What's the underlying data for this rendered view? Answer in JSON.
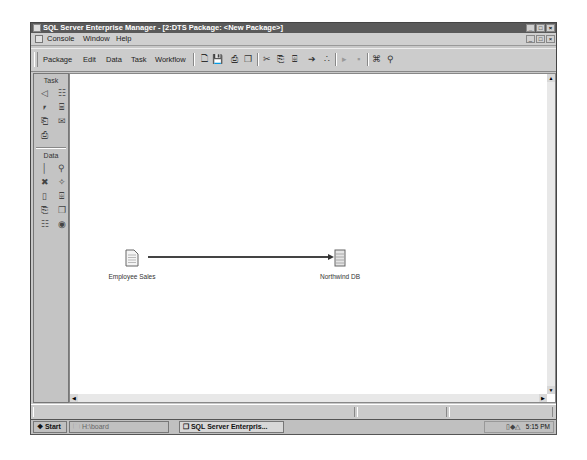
{
  "window": {
    "title": "SQL Server Enterprise Manager - [2:DTS Package: <New Package>]",
    "controls": [
      "_",
      "□",
      "×"
    ]
  },
  "menubar": {
    "items": [
      {
        "label": "Console"
      },
      {
        "label": "Window"
      },
      {
        "label": "Help"
      }
    ],
    "mdi_controls": [
      "_",
      "□",
      "×"
    ]
  },
  "toolbar": {
    "menus": [
      {
        "label": "Package"
      },
      {
        "label": "Edit"
      },
      {
        "label": "Data"
      },
      {
        "label": "Task"
      },
      {
        "label": "Workflow"
      }
    ],
    "buttons": [
      {
        "name": "new-icon",
        "glyph": "🗋"
      },
      {
        "name": "save-icon",
        "glyph": "💾"
      },
      {
        "name": "print-icon",
        "glyph": "⎙"
      },
      {
        "name": "properties-icon",
        "glyph": "❐"
      },
      {
        "name": "cut-icon",
        "glyph": "✂"
      },
      {
        "name": "copy-icon",
        "glyph": "⎘"
      },
      {
        "name": "paste-icon",
        "glyph": "⌹"
      },
      {
        "name": "connect-icon",
        "glyph": "➔"
      },
      {
        "name": "transform-icon",
        "glyph": "∴"
      },
      {
        "name": "run-icon",
        "glyph": "▸"
      },
      {
        "name": "stop-icon",
        "glyph": "▪"
      },
      {
        "name": "layout-icon",
        "glyph": "⌘"
      },
      {
        "name": "zoom-icon",
        "glyph": "⚲"
      }
    ]
  },
  "palette": {
    "task_header": "Task",
    "task_items": [
      {
        "name": "active-x-script-task-icon",
        "glyph": "◁"
      },
      {
        "name": "transfer-objects-task-icon",
        "glyph": "☷"
      },
      {
        "name": "execute-sql-task-icon",
        "glyph": "⎖"
      },
      {
        "name": "data-driven-query-task-icon",
        "glyph": "⌸"
      },
      {
        "name": "bulk-insert-task-icon",
        "glyph": "⎗"
      },
      {
        "name": "send-mail-task-icon",
        "glyph": "✉"
      },
      {
        "name": "execute-process-task-icon",
        "glyph": "⎙"
      }
    ],
    "data_header": "Data",
    "data_items": [
      {
        "name": "sql-server-connection-icon",
        "glyph": "│"
      },
      {
        "name": "access-connection-icon",
        "glyph": "⚲"
      },
      {
        "name": "excel-connection-icon",
        "glyph": "✖"
      },
      {
        "name": "oracle-connection-icon",
        "glyph": "✧"
      },
      {
        "name": "dbase-connection-icon",
        "glyph": "▯"
      },
      {
        "name": "paradox-connection-icon",
        "glyph": "⌹"
      },
      {
        "name": "text-file-source-icon",
        "glyph": "⎘"
      },
      {
        "name": "text-file-destination-icon",
        "glyph": "❐"
      },
      {
        "name": "odbc-connection-icon",
        "glyph": "☷"
      },
      {
        "name": "other-connection-icon",
        "glyph": "◉"
      }
    ]
  },
  "canvas": {
    "nodes": [
      {
        "label": "Employee Sales",
        "icon": "text-file-icon"
      },
      {
        "label": "Northwind DB",
        "icon": "database-server-icon"
      }
    ],
    "connection": {
      "from": "Employee Sales",
      "to": "Northwind DB",
      "type": "transform-data-arrow"
    }
  },
  "scrollbars": {
    "up": "▲",
    "down": "▼",
    "left": "◀",
    "right": "▶"
  },
  "taskbar": {
    "start_label": "Start",
    "buttons": [
      {
        "label": "H:\\board"
      },
      {
        "label": "SQL Server Enterpris..."
      }
    ],
    "clock": "5:15 PM"
  }
}
